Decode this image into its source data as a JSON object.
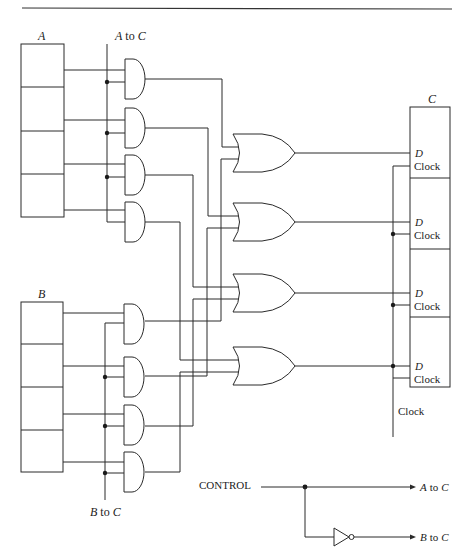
{
  "figure": {
    "colors": {
      "line": "#2a2a2a",
      "background": "#ffffff"
    }
  },
  "labels": {
    "register_a": "A",
    "register_b": "B",
    "register_c": "C",
    "bus_a_to_c": "A to C",
    "bus_b_to_c": "B to C",
    "flipflop_d": "D",
    "flipflop_clock": "Clock",
    "clock_bus": "Clock",
    "control": "CONTROL",
    "out_a_to_c": "A to C",
    "out_b_to_c": "B to C"
  },
  "registers": {
    "a": {
      "x": 21,
      "y": 44,
      "w": 43,
      "cells": 4,
      "cell_h": 43.3
    },
    "b": {
      "x": 21,
      "y": 302,
      "w": 42,
      "cells": 4,
      "cell_h": 42.5
    },
    "c": {
      "x": 410,
      "y": 107,
      "w": 40,
      "cells": 4,
      "cell_h": 70
    }
  },
  "and_gates_a": [
    69,
    118,
    165,
    212
  ],
  "and_gates_b": [
    323,
    375,
    425,
    474
  ],
  "or_gates": [
    153,
    222,
    293,
    366
  ],
  "routing_columns": [
    221,
    207,
    193,
    180
  ]
}
